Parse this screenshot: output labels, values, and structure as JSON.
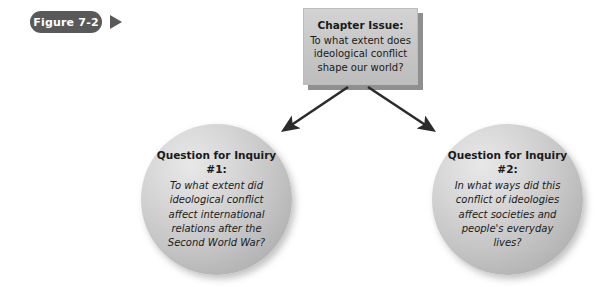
{
  "figure": {
    "label": "Figure 7-2",
    "marker_icon": "play-triangle-icon"
  },
  "chapter_issue": {
    "title": "Chapter Issue:",
    "lines": [
      "To what extent does",
      "ideological conflict",
      "shape our world?"
    ]
  },
  "inquiry_left": {
    "title": "Question for Inquiry",
    "number": "#1:",
    "lines": [
      "To what extent did",
      "ideological conflict",
      "affect international",
      "relations after the",
      "Second World War?"
    ]
  },
  "inquiry_right": {
    "title": "Question for Inquiry",
    "number": "#2:",
    "lines": [
      "In what ways did this",
      "conflict of ideologies",
      "affect societies and",
      "people's everyday",
      "lives?"
    ]
  },
  "connectors": [
    {
      "name": "arrow-to-inquiry-1",
      "from": [
        348,
        87
      ],
      "to": [
        282,
        132
      ]
    },
    {
      "name": "arrow-to-inquiry-2",
      "from": [
        368,
        87
      ],
      "to": [
        435,
        132
      ]
    }
  ],
  "colors": {
    "pill_background": "#595959",
    "pill_text": "#ffffff",
    "box_fill": "#c8c8c8",
    "circle_fill": "#c6c6c6",
    "arrow": "#2b2b2b",
    "text": "#1a1a1a",
    "page_background": "#ffffff"
  }
}
